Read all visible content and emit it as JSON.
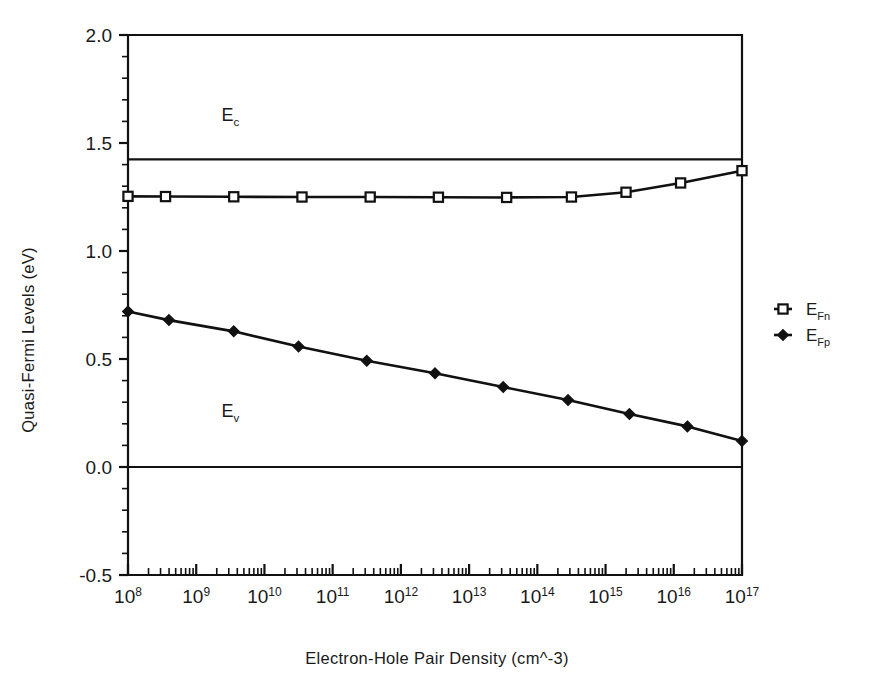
{
  "chart_data": {
    "type": "line",
    "title": "",
    "xlabel": "Electron-Hole Pair Density (cm^-3)",
    "ylabel": "Quasi-Fermi Levels (eV)",
    "x_scale": "log",
    "xlim": [
      100000000.0,
      1e+17
    ],
    "ylim": [
      -0.5,
      2.0
    ],
    "grid": false,
    "legend_position": "right",
    "y_ticks": [
      "2.0",
      "1.5",
      "1.0",
      "0.5",
      "0.0",
      "-0.5"
    ],
    "y_tick_values": [
      2.0,
      1.5,
      1.0,
      0.5,
      0.0,
      -0.5
    ],
    "y_minor_count_per_interval": 4,
    "x_ticks": [
      {
        "base": "10",
        "exp": "8",
        "value": 8
      },
      {
        "base": "10",
        "exp": "9",
        "value": 9
      },
      {
        "base": "10",
        "exp": "10",
        "value": 10
      },
      {
        "base": "10",
        "exp": "11",
        "value": 11
      },
      {
        "base": "10",
        "exp": "12",
        "value": 12
      },
      {
        "base": "10",
        "exp": "13",
        "value": 13
      },
      {
        "base": "10",
        "exp": "14",
        "value": 14
      },
      {
        "base": "10",
        "exp": "15",
        "value": 15
      },
      {
        "base": "10",
        "exp": "16",
        "value": 16
      },
      {
        "base": "10",
        "exp": "17",
        "value": 17
      }
    ],
    "series": [
      {
        "name": "E_Fn",
        "label_base": "E",
        "label_sub": "Fn",
        "marker": "open-square",
        "x_log": [
          8.0,
          8.55,
          9.55,
          10.55,
          11.55,
          12.55,
          13.55,
          14.5,
          15.3,
          16.1,
          17.0
        ],
        "values": [
          1.253,
          1.252,
          1.251,
          1.25,
          1.25,
          1.249,
          1.248,
          1.25,
          1.272,
          1.315,
          1.372
        ]
      },
      {
        "name": "E_Fp",
        "label_base": "E",
        "label_sub": "Fp",
        "marker": "filled-diamond",
        "x_log": [
          8.0,
          8.6,
          9.55,
          10.5,
          11.5,
          12.5,
          13.5,
          14.45,
          15.35,
          16.2,
          17.0
        ],
        "values": [
          0.72,
          0.68,
          0.628,
          0.558,
          0.492,
          0.434,
          0.37,
          0.31,
          0.245,
          0.188,
          0.12
        ]
      }
    ],
    "reference_lines": [
      {
        "name": "Ec",
        "label_base": "E",
        "label_sub": "c",
        "value": 1.424,
        "annotation_x_log": 9.5,
        "annotation_y": 1.6
      },
      {
        "name": "Ev",
        "label_base": "E",
        "label_sub": "v",
        "value": 0.0,
        "annotation_x_log": 9.5,
        "annotation_y": 0.23
      }
    ]
  },
  "colors": {
    "ink": "#111111",
    "background": "#ffffff",
    "marker_fill": "#ffffff"
  },
  "legend": {
    "entries": [
      {
        "label_base": "E",
        "label_sub": "Fn",
        "marker": "open-square"
      },
      {
        "label_base": "E",
        "label_sub": "Fp",
        "marker": "filled-diamond"
      }
    ]
  }
}
